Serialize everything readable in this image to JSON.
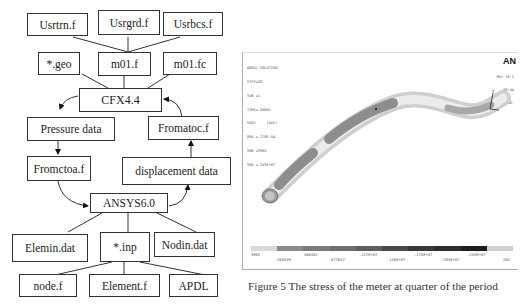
{
  "flowchart": {
    "boxes": {
      "usrtrn": "Usrtrn.f",
      "usrgrd": "Usrgrd.f",
      "usrbcs": "Usrbcs.f",
      "geo": "*.geo",
      "m01f": "m01.f",
      "m01fc": "m01.fc",
      "cfx": "CFX4.4",
      "pressure": "Pressure data",
      "fromatoc": "Fromatoc.f",
      "fromctoa": "Fromctoa.f",
      "displacement": "displacement data",
      "ansys": "ANSYS6.0",
      "elemin": "Elemin.dat",
      "inp": "*.inp",
      "nodin": "Nodin.dat",
      "node": "node.f",
      "element": "Element.f",
      "apdl": "APDL"
    }
  },
  "ansys_plot": {
    "logo": "AN",
    "info_lines": [
      "NODAL SOLUTION",
      "",
      "STEP=26",
      "SUB =1",
      "TIME=.00001",
      "SEQV     (AVG)",
      "DMX =.278E-04",
      "SMN =3965",
      "SMX =.253E+07"
    ],
    "date_lines": [
      "MAY 16 2",
      "06:44",
      "PLOT NO."
    ],
    "legend_colors": [
      "#d8d8d8",
      "#8a8a8a",
      "#7a7a7a",
      "#6e6e6e",
      "#5e5e5e",
      "#4a4a4a",
      "#3a3a3a",
      "#2e2e2e",
      "#1e1e1e",
      "#cfcfcf"
    ],
    "legend_labels_top": [
      "3965",
      "286410",
      "",
      "",
      "",
      "2278E+07",
      "",
      "2533E+07",
      "253"
    ],
    "legend_values": [
      "3965",
      "285839",
      "566461",
      "877647",
      ".117E+07",
      ".146E+07",
      ".175E+07",
      ".204E+07",
      ".233E+07",
      "263"
    ]
  },
  "caption": "Figure 5 The stress of the meter at quarter of the period"
}
